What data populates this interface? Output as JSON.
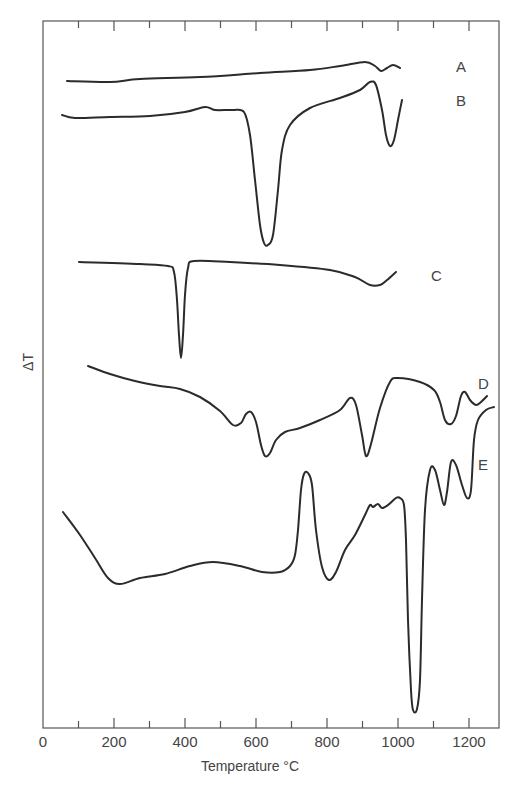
{
  "chart_data": {
    "type": "line",
    "title": "",
    "xlabel": "Temperature °C",
    "ylabel": "ΔT",
    "xlim": [
      0,
      1280
    ],
    "x_ticks": [
      0,
      200,
      400,
      600,
      800,
      1000,
      1200
    ],
    "x_tick_labels": [
      "0",
      "200",
      "400",
      "600",
      "800",
      "1000",
      "1200"
    ],
    "minor_x_ticks": [
      100,
      300,
      500,
      700,
      900,
      1100
    ],
    "grid": false,
    "legend": "inline labels at right of each curve",
    "y_units": "arbitrary (curves offset vertically)",
    "series": [
      {
        "name": "A",
        "label_pos": {
          "x": 456,
          "y": 72
        },
        "points": [
          [
            67,
            81
          ],
          [
            110,
            82
          ],
          [
            140,
            79
          ],
          [
            200,
            77
          ],
          [
            260,
            73
          ],
          [
            310,
            70
          ],
          [
            340,
            66
          ],
          [
            365,
            62
          ],
          [
            375,
            66
          ],
          [
            381,
            71
          ],
          [
            387,
            68
          ],
          [
            393,
            65
          ],
          [
            400,
            68
          ]
        ],
        "features": [
          {
            "type": "endotherm",
            "temp_c": 960,
            "note": "small dip"
          }
        ]
      },
      {
        "name": "B",
        "label_pos": {
          "x": 456,
          "y": 106
        },
        "points": [
          [
            62,
            115
          ],
          [
            75,
            118
          ],
          [
            110,
            117
          ],
          [
            150,
            116
          ],
          [
            185,
            112
          ],
          [
            205,
            107
          ],
          [
            215,
            110
          ],
          [
            232,
            110
          ],
          [
            244,
            112
          ],
          [
            250,
            135
          ],
          [
            255,
            180
          ],
          [
            260,
            225
          ],
          [
            264,
            243
          ],
          [
            268,
            245
          ],
          [
            273,
            235
          ],
          [
            278,
            190
          ],
          [
            282,
            150
          ],
          [
            290,
            125
          ],
          [
            310,
            108
          ],
          [
            340,
            98
          ],
          [
            360,
            90
          ],
          [
            370,
            82
          ],
          [
            376,
            85
          ],
          [
            382,
            110
          ],
          [
            386,
            135
          ],
          [
            390,
            146
          ],
          [
            394,
            140
          ],
          [
            398,
            120
          ],
          [
            402,
            100
          ]
        ],
        "features": [
          {
            "type": "endotherm",
            "temp_c": 630,
            "note": "large sharp peak"
          },
          {
            "type": "endotherm",
            "temp_c": 985,
            "note": "sharp peak"
          }
        ]
      },
      {
        "name": "C",
        "label_pos": {
          "x": 431,
          "y": 281
        },
        "points": [
          [
            79,
            262
          ],
          [
            140,
            264
          ],
          [
            168,
            266
          ],
          [
            174,
            272
          ],
          [
            177,
            300
          ],
          [
            179,
            335
          ],
          [
            181,
            358
          ],
          [
            183,
            335
          ],
          [
            185,
            295
          ],
          [
            188,
            268
          ],
          [
            194,
            261
          ],
          [
            230,
            262
          ],
          [
            280,
            265
          ],
          [
            330,
            270
          ],
          [
            355,
            277
          ],
          [
            370,
            285
          ],
          [
            380,
            285
          ],
          [
            387,
            280
          ],
          [
            396,
            272
          ]
        ],
        "features": [
          {
            "type": "endotherm",
            "temp_c": 385,
            "note": "very sharp narrow peak"
          },
          {
            "type": "endotherm",
            "temp_c": 960,
            "note": "small broad dip"
          }
        ]
      },
      {
        "name": "D",
        "label_pos": {
          "x": 478,
          "y": 389
        },
        "points": [
          [
            88,
            366
          ],
          [
            110,
            374
          ],
          [
            135,
            381
          ],
          [
            160,
            386
          ],
          [
            180,
            389
          ],
          [
            200,
            397
          ],
          [
            220,
            411
          ],
          [
            233,
            425
          ],
          [
            241,
            423
          ],
          [
            246,
            414
          ],
          [
            251,
            412
          ],
          [
            256,
            422
          ],
          [
            261,
            445
          ],
          [
            265,
            456
          ],
          [
            270,
            453
          ],
          [
            276,
            440
          ],
          [
            285,
            432
          ],
          [
            300,
            428
          ],
          [
            320,
            420
          ],
          [
            340,
            410
          ],
          [
            350,
            398
          ],
          [
            356,
            405
          ],
          [
            362,
            435
          ],
          [
            366,
            456
          ],
          [
            371,
            444
          ],
          [
            380,
            408
          ],
          [
            390,
            382
          ],
          [
            398,
            378
          ],
          [
            420,
            382
          ],
          [
            434,
            390
          ],
          [
            440,
            402
          ],
          [
            445,
            420
          ],
          [
            451,
            424
          ],
          [
            456,
            416
          ],
          [
            461,
            396
          ],
          [
            465,
            392
          ],
          [
            470,
            400
          ],
          [
            476,
            405
          ],
          [
            481,
            402
          ],
          [
            487,
            396
          ]
        ],
        "features": [
          {
            "type": "endotherm",
            "temp_c": 550,
            "note": "small dip"
          },
          {
            "type": "endotherm",
            "temp_c": 630,
            "note": "peak"
          },
          {
            "type": "endotherm",
            "temp_c": 920,
            "note": "large peak"
          },
          {
            "type": "endotherm",
            "temp_c": 1150,
            "note": "small peak"
          },
          {
            "type": "endotherm",
            "temp_c": 1230,
            "note": "small dip near end"
          }
        ]
      },
      {
        "name": "E",
        "label_pos": {
          "x": 478,
          "y": 470
        },
        "points": [
          [
            63,
            512
          ],
          [
            80,
            535
          ],
          [
            95,
            558
          ],
          [
            108,
            578
          ],
          [
            120,
            584
          ],
          [
            140,
            578
          ],
          [
            165,
            574
          ],
          [
            190,
            566
          ],
          [
            213,
            562
          ],
          [
            240,
            566
          ],
          [
            262,
            572
          ],
          [
            280,
            572
          ],
          [
            290,
            566
          ],
          [
            295,
            555
          ],
          [
            298,
            530
          ],
          [
            301,
            490
          ],
          [
            304,
            474
          ],
          [
            308,
            473
          ],
          [
            312,
            485
          ],
          [
            316,
            530
          ],
          [
            322,
            567
          ],
          [
            329,
            580
          ],
          [
            336,
            572
          ],
          [
            345,
            550
          ],
          [
            355,
            535
          ],
          [
            365,
            515
          ],
          [
            370,
            505
          ],
          [
            373,
            507
          ],
          [
            378,
            504
          ],
          [
            382,
            508
          ],
          [
            388,
            505
          ],
          [
            396,
            498
          ],
          [
            400,
            498
          ],
          [
            404,
            505
          ],
          [
            406,
            540
          ],
          [
            408,
            620
          ],
          [
            411,
            690
          ],
          [
            413,
            710
          ],
          [
            417,
            709
          ],
          [
            420,
            680
          ],
          [
            422,
            600
          ],
          [
            425,
            510
          ],
          [
            430,
            470
          ],
          [
            435,
            470
          ],
          [
            440,
            490
          ],
          [
            444,
            505
          ],
          [
            447,
            492
          ],
          [
            451,
            462
          ],
          [
            456,
            465
          ],
          [
            462,
            485
          ],
          [
            467,
            498
          ],
          [
            471,
            490
          ],
          [
            474,
            440
          ],
          [
            478,
            420
          ],
          [
            486,
            410
          ],
          [
            494,
            407
          ]
        ],
        "features": [
          {
            "type": "endotherm",
            "temp_c": 200,
            "note": "broad dip"
          },
          {
            "type": "exotherm",
            "temp_c": 740,
            "note": "sharp peak"
          },
          {
            "type": "endotherm",
            "temp_c": 810,
            "note": "peak"
          },
          {
            "type": "endotherm",
            "temp_c": 1060,
            "note": "very deep sharp peak"
          },
          {
            "type": "endotherm",
            "temp_c": 1140,
            "note": "small peak"
          },
          {
            "type": "endotherm",
            "temp_c": 1200,
            "note": "small peak"
          }
        ]
      }
    ]
  },
  "axis": {
    "xlabel": "Temperature °C",
    "ylabel": "ΔT",
    "tick_labels": [
      "0",
      "200",
      "400",
      "600",
      "800",
      "1000",
      "1200"
    ]
  }
}
